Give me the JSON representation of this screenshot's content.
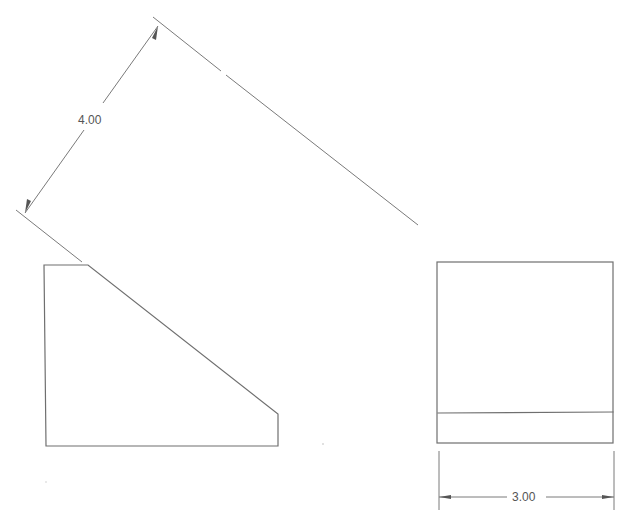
{
  "drawing": {
    "type": "orthographic-projection",
    "views": [
      {
        "name": "side-view",
        "shape": "chamfered-block",
        "outline": [
          [
            44,
            265
          ],
          [
            88,
            265
          ],
          [
            278,
            414
          ],
          [
            278,
            446
          ],
          [
            46,
            446
          ]
        ]
      },
      {
        "name": "end-view",
        "shape": "rectangle-with-edge-line",
        "rect": [
          437,
          262,
          613,
          443
        ],
        "edge_line_y": 413
      }
    ],
    "dimensions": [
      {
        "name": "inclined-length",
        "label": "4.00",
        "orientation": "aligned"
      },
      {
        "name": "width",
        "label": "3.00",
        "orientation": "horizontal"
      }
    ],
    "colors": {
      "background": "#ffffff",
      "line": "#6f6f6f",
      "text": "#555555"
    }
  }
}
